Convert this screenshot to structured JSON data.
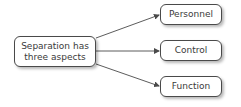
{
  "diagram": {
    "type": "flow",
    "source": {
      "label": "Separation has\nthree aspects"
    },
    "targets": [
      {
        "label": "Personnel"
      },
      {
        "label": "Control"
      },
      {
        "label": "Function"
      }
    ],
    "edges": [
      {
        "from": "source",
        "to": "Personnel"
      },
      {
        "from": "source",
        "to": "Control"
      },
      {
        "from": "source",
        "to": "Function"
      }
    ],
    "colors": {
      "stroke": "#4a4a4a",
      "text": "#3a3a3a",
      "background": "#ffffff"
    }
  }
}
